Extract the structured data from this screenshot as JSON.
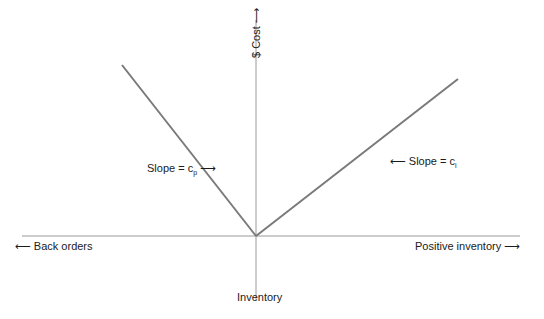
{
  "axes": {
    "y_label": "$ Cost",
    "y_arrow": "⟶",
    "x_label": "Inventory",
    "left_label": "Back orders",
    "left_arrow": "⟵",
    "right_label": "Positive inventory",
    "right_arrow": "⟶"
  },
  "annotations": {
    "left_slope_prefix": "Slope = c",
    "left_slope_sub": "p",
    "left_slope_arrow": "⟶",
    "right_slope_prefix": "Slope = c",
    "right_slope_sub": "i",
    "right_slope_arrow": "⟵"
  },
  "colors": {
    "cost_line": "#7a7a7a",
    "axis_line": "#9a9a9a"
  }
}
